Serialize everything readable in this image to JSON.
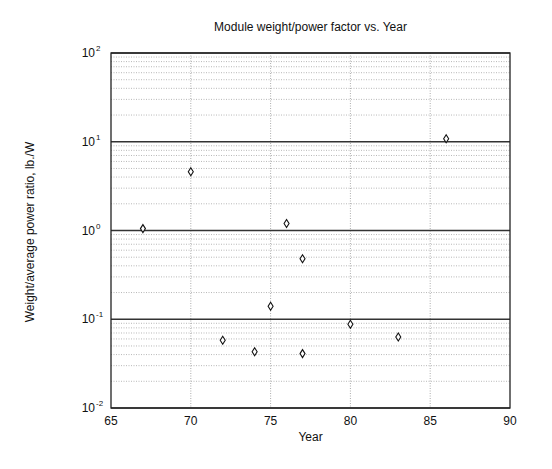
{
  "chart_data": {
    "type": "scatter",
    "title": "Module weight/power factor vs. Year",
    "xlabel": "Year",
    "ylabel": "Weight/average power ratio, lb./W",
    "xlim": [
      65,
      90
    ],
    "ylim": [
      0.01,
      100
    ],
    "yscale": "log",
    "xticks": [
      65,
      70,
      75,
      80,
      85,
      90
    ],
    "yticks": [
      {
        "base": "10",
        "exp": "-2",
        "value": 0.01
      },
      {
        "base": "10",
        "exp": "-1",
        "value": 0.1
      },
      {
        "base": "10",
        "exp": "0",
        "value": 1
      },
      {
        "base": "10",
        "exp": "1",
        "value": 10
      },
      {
        "base": "10",
        "exp": "2",
        "value": 100
      }
    ],
    "grid": true,
    "marker": "diamond",
    "legend": null,
    "series": [
      {
        "name": "modules",
        "points": [
          {
            "x": 67,
            "y": 1.05
          },
          {
            "x": 70,
            "y": 4.6
          },
          {
            "x": 72,
            "y": 0.058
          },
          {
            "x": 74,
            "y": 0.043
          },
          {
            "x": 75,
            "y": 0.14
          },
          {
            "x": 76,
            "y": 1.2
          },
          {
            "x": 77,
            "y": 0.48
          },
          {
            "x": 77,
            "y": 0.041
          },
          {
            "x": 80,
            "y": 0.088
          },
          {
            "x": 83,
            "y": 0.063
          },
          {
            "x": 86,
            "y": 10.8
          }
        ]
      }
    ]
  }
}
